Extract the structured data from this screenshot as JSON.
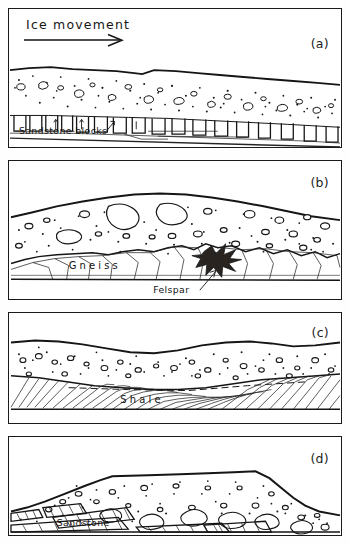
{
  "figure": {
    "header": {
      "ice_movement_label": "Ice movement",
      "arrow_icon": "right-arrow-icon"
    },
    "panels": [
      {
        "id": "a",
        "letter": "(a)",
        "bed_label": "Sandstone blocks",
        "bed_type": "sandstone-blocks",
        "description": "Till sheet over quarried rectangular sandstone blocks"
      },
      {
        "id": "b",
        "letter": "(b)",
        "bed_label": "Gneiss",
        "annotation_label": "Felspar",
        "bed_type": "gneiss",
        "description": "Till lens over fractured gneiss with felspar crystal"
      },
      {
        "id": "c",
        "letter": "(c)",
        "bed_label": "Shale",
        "bed_type": "shale",
        "description": "Till over sheared and dragged shale laminae"
      },
      {
        "id": "d",
        "letter": "(d)",
        "bed_label": "Sandstone",
        "bed_type": "sandstone-slabs",
        "description": "Till mound over imbricated sandstone slabs"
      }
    ],
    "colors": {
      "ink": "#151515",
      "paper": "#ffffff"
    }
  }
}
